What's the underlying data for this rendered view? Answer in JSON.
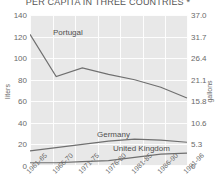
{
  "chart_data": {
    "type": "line",
    "title": "PER CAPITA IN THREE COUNTRIES *",
    "xlabel": "",
    "ylabel": "liters",
    "y2label": "gallons",
    "ylim": [
      0,
      140
    ],
    "y2lim": [
      0,
      37.0
    ],
    "grid": true,
    "legend_position": "inline-series-labels",
    "categories": [
      "1961-65",
      "1966-70",
      "1971-75",
      "1976-80",
      "1981-85",
      "1986-90",
      "1991-96"
    ],
    "yticks": [
      "0",
      "20",
      "40",
      "60",
      "80",
      "100",
      "120",
      "140"
    ],
    "y2ticks": [
      "0",
      "5.3",
      "10.6",
      "15.8",
      "21.1",
      "26.4",
      "31.7",
      "37.0"
    ],
    "series": [
      {
        "name": "Portugal",
        "values": [
          122,
          83,
          91,
          85,
          80,
          73,
          63
        ]
      },
      {
        "name": "Germany",
        "values": [
          14,
          17,
          20,
          23,
          25,
          24,
          22
        ]
      },
      {
        "name": "United Kingdom",
        "values": [
          3,
          3,
          4,
          5,
          8,
          11,
          12
        ]
      }
    ]
  },
  "series_labels": {
    "portugal": "Portugal",
    "germany": "Germany",
    "united_kingdom": "United Kingdom"
  }
}
